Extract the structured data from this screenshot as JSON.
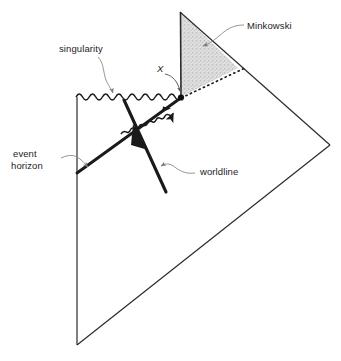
{
  "figure": {
    "kind": "penrose-diagram",
    "title_text": "",
    "background_color": "#ffffff",
    "line_color": "#2b2b2b",
    "shade_color": "#d8d8d8",
    "text_color": "#1c1c1c"
  },
  "labels": {
    "minkowski": "Minkowski",
    "singularity": "singularity",
    "event_horizon_line1": "event",
    "event_horizon_line2": "horizon",
    "worldline": "worldline",
    "x_point": "X"
  },
  "regions": {
    "minkowski_triangle": {
      "name": "Minkowski",
      "fill": "#d9d9d9",
      "vertices": [
        [
          180,
          12
        ],
        [
          181,
          97
        ],
        [
          238,
          68
        ]
      ]
    },
    "black_hole_exterior": {
      "name": "exterior-diamond",
      "fill": "none",
      "vertices": [
        [
          77,
          97
        ],
        [
          181,
          97
        ],
        [
          330,
          145
        ],
        [
          77,
          345
        ]
      ]
    }
  },
  "features": {
    "singularity": {
      "style": "wavy",
      "from": [
        76,
        97
      ],
      "to": [
        181,
        97
      ]
    },
    "event_horizon": {
      "style": "solid-thick",
      "from": [
        77,
        173
      ],
      "to": [
        181,
        97
      ]
    },
    "left_boundary": {
      "style": "solid-thin",
      "from": [
        77,
        97
      ],
      "to": [
        77,
        345
      ]
    },
    "null_infinity_upper": {
      "style": "solid-thin",
      "from": [
        181,
        97
      ],
      "to": [
        330,
        145
      ]
    },
    "null_infinity_lower": {
      "style": "solid-thin",
      "from": [
        77,
        345
      ],
      "to": [
        330,
        145
      ]
    },
    "evaporation_dashed": {
      "style": "dashed",
      "from": [
        181,
        97
      ],
      "to": [
        243,
        68
      ]
    },
    "worldline": {
      "style": "solid-thick-arrow",
      "from": [
        165,
        192
      ],
      "to": [
        123,
        99
      ],
      "arrow_at": [
        139,
        136
      ]
    },
    "hawking_radiation": {
      "style": "wavy-arrow",
      "from": [
        122,
        133
      ],
      "to": [
        192,
        92
      ]
    },
    "point_X": {
      "style": "filled-dot",
      "at": [
        181,
        97
      ]
    }
  },
  "annotations": [
    {
      "name": "minkowski-callout",
      "label": "Minkowski",
      "text_pos": [
        248,
        21
      ],
      "leader_from": [
        244,
        25
      ],
      "leader_to": [
        201,
        46
      ]
    },
    {
      "name": "singularity-callout",
      "label": "singularity",
      "text_pos": [
        60,
        47
      ],
      "leader_from": [
        98,
        57
      ],
      "leader_to": [
        113,
        94
      ]
    },
    {
      "name": "event-horizon-callout",
      "label": "event horizon",
      "text_pos": [
        12,
        152
      ],
      "leader_from": [
        62,
        158
      ],
      "leader_to": [
        89,
        167
      ]
    },
    {
      "name": "worldline-callout",
      "label": "worldline",
      "text_pos": [
        200,
        169
      ],
      "leader_from": [
        196,
        173
      ],
      "leader_to": [
        160,
        166
      ]
    },
    {
      "name": "x-callout",
      "label": "X",
      "text_pos": [
        158,
        66
      ],
      "leader_from": [
        166,
        76
      ],
      "leader_to": [
        179,
        93
      ]
    }
  ]
}
